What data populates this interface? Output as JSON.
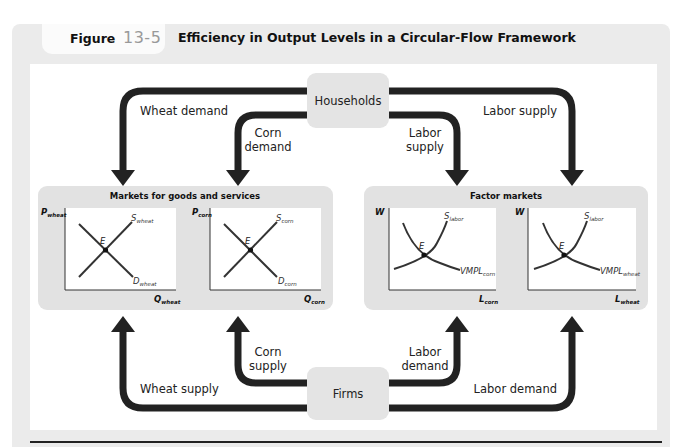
{
  "figure": {
    "label_word": "Figure",
    "label_number": "13-5",
    "title": "Efficiency in Output Levels in a Circular-Flow Framework"
  },
  "colors": {
    "frame": "#ebebeb",
    "panel": "#e2e2e2",
    "node": "#e4e4e4",
    "arrow": "#222222",
    "curve": "#333333"
  },
  "nodes": {
    "households": "Households",
    "firms": "Firms"
  },
  "flows": {
    "wheat_demand": "Wheat demand",
    "corn_demand_1": "Corn",
    "corn_demand_2": "demand",
    "labor_supply_inner_1": "Labor",
    "labor_supply_inner_2": "supply",
    "labor_supply_outer": "Labor supply",
    "wheat_supply": "Wheat supply",
    "corn_supply_1": "Corn",
    "corn_supply_2": "supply",
    "labor_demand_inner_1": "Labor",
    "labor_demand_inner_2": "demand",
    "labor_demand_outer": "Labor demand"
  },
  "panels": {
    "goods": {
      "title": "Markets for goods and services",
      "wheat": {
        "y_axis": "P",
        "y_sub": "wheat",
        "x_axis": "Q",
        "x_sub": "wheat",
        "supply": "S",
        "supply_sub": "wheat",
        "demand": "D",
        "demand_sub": "wheat",
        "equilibrium": "E"
      },
      "corn": {
        "y_axis": "P",
        "y_sub": "corn",
        "x_axis": "Q",
        "x_sub": "corn",
        "supply": "S",
        "supply_sub": "corn",
        "demand": "D",
        "demand_sub": "corn",
        "equilibrium": "E"
      }
    },
    "factor": {
      "title": "Factor markets",
      "corn": {
        "y_axis": "W",
        "x_axis": "L",
        "x_sub": "corn",
        "supply": "S",
        "supply_sub": "labor",
        "demand": "VMPL",
        "demand_sub": "corn",
        "equilibrium": "E"
      },
      "wheat": {
        "y_axis": "W",
        "x_axis": "L",
        "x_sub": "wheat",
        "supply": "S",
        "supply_sub": "labor",
        "demand": "VMPL",
        "demand_sub": "wheat",
        "equilibrium": "E"
      }
    }
  }
}
